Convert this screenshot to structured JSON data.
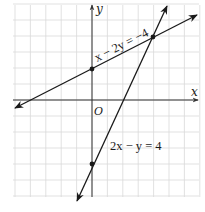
{
  "figure": {
    "type": "coordinate-graph",
    "axes": {
      "x_label": "x",
      "y_label": "y",
      "origin_label": "O",
      "x_range": [
        -5,
        7
      ],
      "y_range": [
        -6,
        6
      ],
      "grid": true
    },
    "lines": [
      {
        "equation": "x − 2y = −4",
        "slope_intercept": "y = x/2 + 2",
        "marked_points": [
          [
            0,
            2
          ],
          [
            4,
            4
          ]
        ]
      },
      {
        "equation": "2x − y = 4",
        "slope_intercept": "y = 2x − 4",
        "marked_points": [
          [
            0,
            -4
          ],
          [
            4,
            4
          ]
        ]
      }
    ],
    "intersection": [
      4,
      4
    ],
    "colors": {
      "grid": "#d9d9d9",
      "axes": "#333333",
      "lines": "#1a1a1a",
      "background": "#ffffff"
    }
  }
}
